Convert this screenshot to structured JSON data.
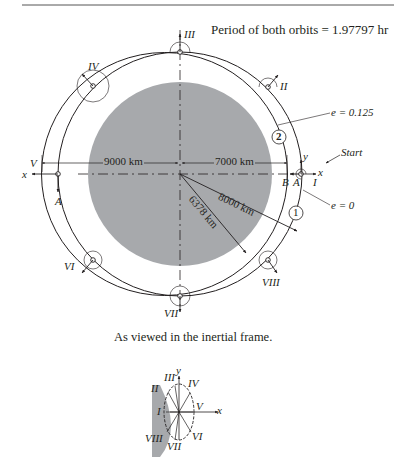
{
  "header_rule": true,
  "title": "Period of both orbits = 1.97797 hr",
  "caption": "As viewed in the inertial frame.",
  "dimensions": {
    "apogee": "9000 km",
    "perigee": "7000 km",
    "circular_radius": "8000 km",
    "earth_radius": "6378 km"
  },
  "orbit_labels": {
    "ellipse_ecc": "e = 0.125",
    "circle_ecc": "e = 0",
    "ellipse_id": "2",
    "circle_id": "1",
    "start": "Start",
    "point_A": "A",
    "point_A2": "A",
    "point_B": "B"
  },
  "positions": [
    "I",
    "II",
    "III",
    "IV",
    "V",
    "VI",
    "VII",
    "VIII"
  ],
  "axes": {
    "x": "x",
    "y": "y"
  },
  "inset": {
    "labels": [
      "I",
      "II",
      "III",
      "IV",
      "V",
      "VI",
      "VII",
      "VIII"
    ],
    "x": "x",
    "y": "y"
  },
  "colors": {
    "earth": "#a7a9ac",
    "line": "#231f20"
  }
}
